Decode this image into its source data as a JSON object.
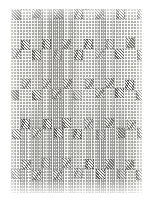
{
  "plate": {
    "title": "Textile pattern swatch",
    "description": "Vintage engraved illustration of a woven fabric sample",
    "technique": "stipple and line engraving",
    "motif_name": "diagonal-hatched square",
    "background_name": "stippled ground with vertical warp stripes",
    "colors": {
      "paper": "#ffffff",
      "plate_ground": "#fbfbfa",
      "stipple": "#9a9a96",
      "motif_ink": "#4a4a46",
      "stripe_ink": "#69695f"
    },
    "geometry": {
      "page_width": 152,
      "page_height": 203,
      "plate_left": 11,
      "plate_top": 9,
      "plate_width": 131,
      "plate_height": 184,
      "motif_width": 9,
      "motif_height": 10,
      "motif_angle_deg": 48,
      "grid_step_x": 21,
      "grid_step_y": 20,
      "grid_columns": 7,
      "grid_rows": 10,
      "stagger_offset_x": 10,
      "stagger_offset_y": 10
    }
  }
}
